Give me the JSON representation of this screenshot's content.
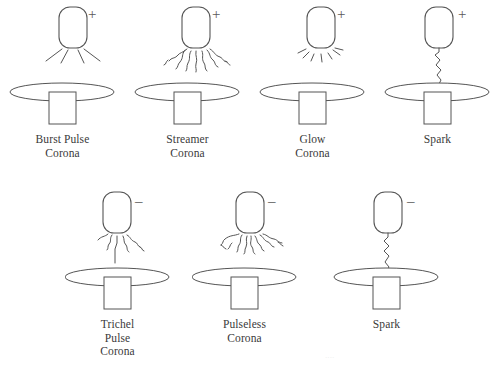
{
  "figure": {
    "line_color": "#555555",
    "text_color": "#3a3a3a",
    "background": "#ffffff",
    "width": 500,
    "height": 365
  },
  "rows": [
    {
      "polarity_symbol": "+",
      "polarity_name": "positive",
      "cells": [
        {
          "caption_lines": [
            "Burst Pulse",
            "Corona"
          ],
          "discharge_type": "burst-pulse",
          "description": "short straight radiating rays from electrode tip"
        },
        {
          "caption_lines": [
            "Streamer",
            "Corona"
          ],
          "discharge_type": "streamer",
          "description": "long wiggly branching filaments spreading outward"
        },
        {
          "caption_lines": [
            "Glow",
            "Corona"
          ],
          "discharge_type": "glow",
          "description": "short dashed rays close around the electrode tip"
        },
        {
          "caption_lines": [
            "Spark"
          ],
          "discharge_type": "spark",
          "description": "single zigzag channel bridging electrode to plate"
        }
      ]
    },
    {
      "polarity_symbol": "–",
      "polarity_name": "negative",
      "cells": [
        {
          "caption_lines": [
            "Trichel",
            "Pulse",
            "Corona"
          ],
          "discharge_type": "trichel-pulse",
          "description": "few crooked branches with one long downward stem"
        },
        {
          "caption_lines": [
            "Pulseless",
            "Corona"
          ],
          "discharge_type": "pulseless",
          "description": "many short crooked hooked filaments fanning out"
        },
        {
          "caption_lines": [
            "Spark"
          ],
          "discharge_type": "spark",
          "description": "single zigzag channel bridging electrode to plate"
        }
      ]
    }
  ],
  "footer": {
    "faint_mark": "····"
  }
}
